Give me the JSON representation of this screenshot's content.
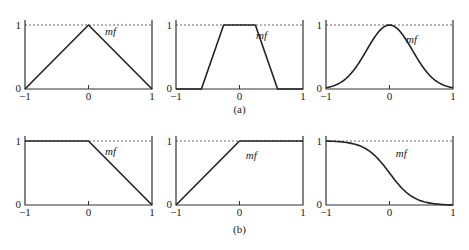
{
  "figure": {
    "captions": [
      "(a)",
      "(b)"
    ],
    "curve_label": "mf",
    "x_ticks": [
      "-1",
      "0",
      "1"
    ],
    "y_ticks": [
      "0",
      "1"
    ]
  },
  "chart_data": [
    {
      "type": "line",
      "row": "a",
      "name": "triangular",
      "x": [
        -1,
        0,
        1
      ],
      "y": [
        0,
        1,
        0
      ],
      "xlim": [
        -1,
        1
      ],
      "ylim": [
        0,
        1
      ],
      "label": "mf"
    },
    {
      "type": "line",
      "row": "a",
      "name": "trapezoidal",
      "x": [
        -1,
        -0.6,
        -0.25,
        0.25,
        0.6,
        1
      ],
      "y": [
        0,
        0,
        1,
        1,
        0,
        0
      ],
      "xlim": [
        -1,
        1
      ],
      "ylim": [
        0,
        1
      ],
      "label": "mf"
    },
    {
      "type": "line",
      "row": "a",
      "name": "gaussian",
      "x": [
        -1,
        -0.75,
        -0.5,
        -0.25,
        0,
        0.25,
        0.5,
        0.75,
        1
      ],
      "y": [
        0,
        0.04,
        0.25,
        0.7,
        1,
        0.7,
        0.25,
        0.04,
        0
      ],
      "xlim": [
        -1,
        1
      ],
      "ylim": [
        0,
        1
      ],
      "label": "mf"
    },
    {
      "type": "line",
      "row": "b",
      "name": "left-shoulder (Z)",
      "x": [
        -1,
        0,
        1
      ],
      "y": [
        1,
        1,
        0
      ],
      "xlim": [
        -1,
        1
      ],
      "ylim": [
        0,
        1
      ],
      "label": "mf"
    },
    {
      "type": "line",
      "row": "b",
      "name": "right-shoulder (S)",
      "x": [
        -1,
        0,
        1
      ],
      "y": [
        0,
        1,
        1
      ],
      "xlim": [
        -1,
        1
      ],
      "ylim": [
        0,
        1
      ],
      "label": "mf"
    },
    {
      "type": "line",
      "row": "b",
      "name": "sigmoid (decreasing)",
      "x": [
        -1,
        -0.5,
        0,
        0.5,
        1
      ],
      "y": [
        1,
        0.9,
        0.5,
        0.1,
        0
      ],
      "xlim": [
        -1,
        1
      ],
      "ylim": [
        0,
        1
      ],
      "label": "mf"
    }
  ]
}
